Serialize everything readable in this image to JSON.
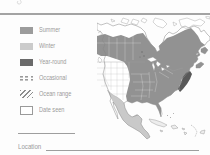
{
  "legend": {
    "items": [
      {
        "label": "Summer",
        "swatch": "solid",
        "color": "#9c9c9c"
      },
      {
        "label": "Winter",
        "swatch": "solid",
        "color": "#cbcbcb"
      },
      {
        "label": "Year-round",
        "swatch": "solid",
        "color": "#6a6a6a"
      },
      {
        "label": "Occasional",
        "swatch": "dashed-pattern",
        "color": "#9a9a9a"
      },
      {
        "label": "Ocean range",
        "swatch": "diagonal-hatch",
        "color": "#8e8e8e"
      },
      {
        "label": "Date seen",
        "swatch": "empty-box",
        "color": "#9a9a9a"
      }
    ]
  },
  "fields": {
    "location_label": "Location"
  },
  "map": {
    "type": "range-map",
    "area": "North America",
    "region_colors": {
      "summer": "#929292",
      "winter": "#c9c9c9",
      "year_round": "#585858"
    }
  }
}
